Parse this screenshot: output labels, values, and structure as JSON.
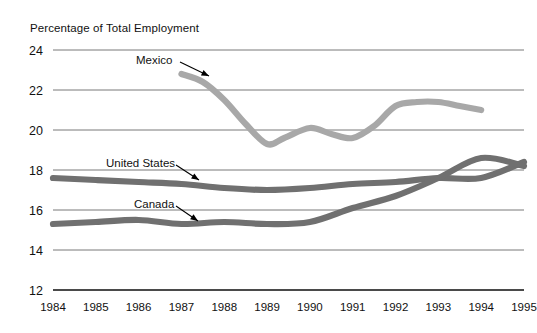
{
  "chart_data": {
    "type": "line",
    "title": "Percentage of Total Employment",
    "xlabel": "",
    "ylabel": "Percentage of Total Employment",
    "grid": true,
    "legend_position": "inline-annotations",
    "x": [
      1984,
      1985,
      1986,
      1987,
      1988,
      1989,
      1990,
      1991,
      1992,
      1993,
      1994,
      1995
    ],
    "categories": [
      "1984",
      "1985",
      "1986",
      "1987",
      "1988",
      "1989",
      "1990",
      "1991",
      "1992",
      "1993",
      "1994",
      "1995"
    ],
    "xlim": [
      1984,
      1995
    ],
    "ylim": [
      12,
      24
    ],
    "yticks": [
      12,
      14,
      16,
      18,
      20,
      22,
      24
    ],
    "ytick_labels": [
      "12",
      "14",
      "16",
      "18",
      "20",
      "22",
      "24"
    ],
    "series": [
      {
        "name": "Mexico",
        "color": "#a8a8a8",
        "x": [
          1987,
          1987.5,
          1988,
          1988.5,
          1989,
          1989.4,
          1990,
          1990.5,
          1991,
          1991.5,
          1992,
          1992.5,
          1993,
          1993.5,
          1994
        ],
        "values": [
          22.8,
          22.4,
          21.5,
          20.3,
          19.3,
          19.6,
          20.1,
          19.8,
          19.6,
          20.2,
          21.2,
          21.4,
          21.4,
          21.2,
          21.0
        ]
      },
      {
        "name": "United States",
        "color": "#707070",
        "x": [
          1984,
          1985,
          1986,
          1987,
          1988,
          1989,
          1990,
          1991,
          1992,
          1993,
          1994,
          1995
        ],
        "values": [
          17.6,
          17.5,
          17.4,
          17.3,
          17.1,
          17.0,
          17.1,
          17.3,
          17.4,
          17.6,
          17.6,
          18.4
        ]
      },
      {
        "name": "Canada",
        "color": "#707070",
        "x": [
          1984,
          1985,
          1986,
          1987,
          1988,
          1989,
          1990,
          1991,
          1992,
          1993,
          1994,
          1995
        ],
        "values": [
          15.3,
          15.4,
          15.5,
          15.3,
          15.4,
          15.3,
          15.4,
          16.1,
          16.7,
          17.6,
          18.6,
          18.2
        ]
      }
    ],
    "annotations": [
      {
        "text": "Mexico",
        "label_x": 136,
        "label_y": 64,
        "arrow_from_x": 180,
        "arrow_from_y": 62,
        "arrow_to_x": 209,
        "arrow_to_y": 76
      },
      {
        "text": "United States",
        "label_x": 106,
        "label_y": 167,
        "arrow_from_x": 176,
        "arrow_from_y": 165,
        "arrow_to_x": 199,
        "arrow_to_y": 180
      },
      {
        "text": "Canada",
        "label_x": 134,
        "label_y": 208,
        "arrow_from_x": 176,
        "arrow_from_y": 206,
        "arrow_to_x": 198,
        "arrow_to_y": 221
      }
    ]
  }
}
